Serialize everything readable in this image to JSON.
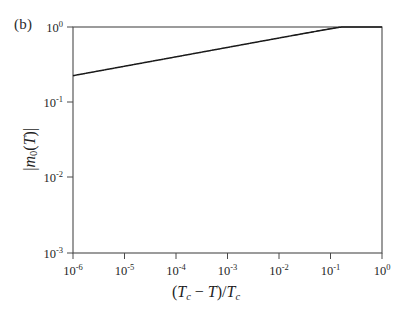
{
  "figure": {
    "panel_label": "(b)",
    "background_color": "#ffffff",
    "line_color": "#1a1a1a"
  },
  "axes": {
    "x": {
      "label_plain": "(Tc - T)/Tc",
      "label_parts": {
        "open": "(",
        "t_c_1": "T",
        "sub_c_1": "c",
        "minus": " − ",
        "t_2": "T",
        "close_slash": ")/",
        "t_c_3": "T",
        "sub_c_3": "c"
      },
      "scale": "log",
      "min": 1e-06,
      "max": 1,
      "tick_values": [
        1e-06,
        1e-05,
        0.0001,
        0.001,
        0.01,
        0.1,
        1
      ],
      "tick_labels": [
        "10-6",
        "10-5",
        "10-4",
        "10-3",
        "10-2",
        "10-1",
        "100"
      ],
      "tick_mantissas": [
        "10",
        "10",
        "10",
        "10",
        "10",
        "10",
        "10"
      ],
      "tick_exponents": [
        "-6",
        "-5",
        "-4",
        "-3",
        "-2",
        "-1",
        "0"
      ]
    },
    "y": {
      "label_plain": "|m0(T)|",
      "label_parts": {
        "bar_open": "|",
        "m": "m",
        "sub_0": "0",
        "paren_open": "(",
        "t": "T",
        "paren_close": ")",
        "bar_close": "|"
      },
      "scale": "log",
      "min": 0.001,
      "max": 1,
      "tick_values": [
        0.001,
        0.01,
        0.1,
        1
      ],
      "tick_labels": [
        "10-3",
        "10-2",
        "10-1",
        "100"
      ],
      "tick_mantissas": [
        "10",
        "10",
        "10",
        "10"
      ],
      "tick_exponents": [
        "-3",
        "-2",
        "-1",
        "0"
      ]
    }
  },
  "chart_data": {
    "type": "line",
    "title": "",
    "subtitle": "",
    "xlabel": "(Tc - T)/Tc",
    "ylabel": "|m0(T)|",
    "xscale": "log",
    "yscale": "log",
    "xlim": [
      1e-06,
      1
    ],
    "ylim": [
      0.001,
      1
    ],
    "grid": false,
    "legend": "none",
    "annotations": [
      "(b)"
    ],
    "series": [
      {
        "name": "exact-magnetization",
        "style": "solid",
        "color": "#1a1a1a",
        "x": [
          1e-06,
          3.16e-06,
          1e-05,
          3.16e-05,
          0.0001,
          0.000316,
          0.001,
          0.00316,
          0.01,
          0.0316,
          0.1,
          0.2,
          0.3,
          0.4,
          0.5,
          0.6,
          0.7,
          0.8,
          0.9,
          1.0
        ],
        "y": [
          0.00178,
          0.00211,
          0.00251,
          0.00298,
          0.00355,
          0.00421,
          0.00501,
          0.00595,
          0.00708,
          0.0154,
          0.0335,
          0.0687,
          0.126,
          0.202,
          0.297,
          0.417,
          0.556,
          0.716,
          0.875,
          1.0
        ]
      },
      {
        "name": "asymptotic-power-law",
        "style": "dashed",
        "color": "#555555",
        "exponent": 0.125,
        "x": [
          0.03,
          0.06,
          0.1,
          0.2,
          0.3,
          0.4,
          0.5,
          0.6,
          0.7,
          0.8,
          0.9,
          1.0
        ],
        "y": [
          0.0148,
          0.0312,
          0.0335,
          0.0714,
          0.136,
          0.223,
          0.333,
          0.466,
          0.621,
          0.795,
          0.99,
          1.0
        ]
      }
    ]
  }
}
